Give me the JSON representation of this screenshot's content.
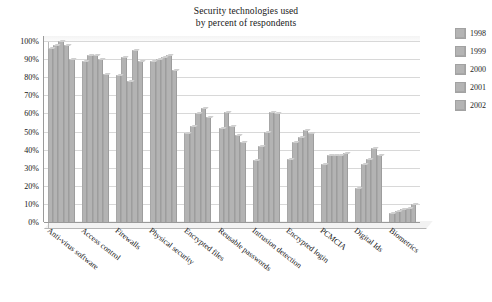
{
  "chart_data": {
    "type": "bar",
    "title": "Security technologies used by percent of respondents",
    "title_line1": "Security technologies used",
    "title_line2": "by percent of respondents",
    "xlabel": "",
    "ylabel": "",
    "ylim": [
      0,
      100
    ],
    "ytick_labels": [
      "100%",
      "90%",
      "80%",
      "70%",
      "60%",
      "50%",
      "40%",
      "30%",
      "20%",
      "10%",
      "0%"
    ],
    "ytick_values": [
      100,
      90,
      80,
      70,
      60,
      50,
      40,
      30,
      20,
      10,
      0
    ],
    "grid": true,
    "legend_position": "right",
    "bar_color": "#b3b3b3",
    "grid_color": "#d8d8d8",
    "axis_color": "#9a9a9a",
    "categories": [
      "Anti-virus software",
      "Access control",
      "Firewalls",
      "Physical security",
      "Encrypted files",
      "Reusable passwords",
      "Intrusion detection",
      "Encrypted login",
      "PCMCIA",
      "Digital Ids",
      "Biometrics"
    ],
    "series": [
      {
        "name": "1998",
        "values": [
          96,
          89,
          81,
          89,
          49,
          52,
          34,
          35,
          32,
          19,
          5
        ]
      },
      {
        "name": "1999",
        "values": [
          98,
          92,
          91,
          90,
          53,
          61,
          42,
          44,
          37,
          32,
          6
        ]
      },
      {
        "name": "2000",
        "values": [
          100,
          92,
          78,
          91,
          60,
          53,
          50,
          47,
          37,
          35,
          7
        ]
      },
      {
        "name": "2001",
        "values": [
          98,
          90,
          95,
          92,
          63,
          48,
          61,
          51,
          37,
          41,
          8
        ]
      },
      {
        "name": "2002",
        "values": [
          90,
          82,
          89,
          84,
          58,
          44,
          60,
          49,
          38,
          37,
          10
        ]
      }
    ]
  },
  "legend": {
    "items": [
      {
        "label": "1998",
        "color": "#b4b4b4"
      },
      {
        "label": "1999",
        "color": "#b4b4b4"
      },
      {
        "label": "2000",
        "color": "#b4b4b4"
      },
      {
        "label": "2001",
        "color": "#b4b4b4"
      },
      {
        "label": "2002",
        "color": "#b4b4b4"
      }
    ]
  }
}
